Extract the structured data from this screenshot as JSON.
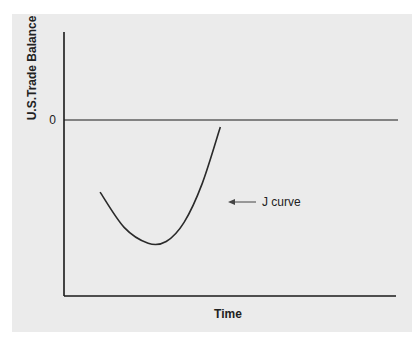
{
  "chart_data": {
    "type": "line",
    "title": "",
    "xlabel": "Time",
    "ylabel": "U.S.Trade Balance",
    "y_ticks": [
      "0"
    ],
    "xlim": [
      0,
      10
    ],
    "ylim": [
      -10,
      5
    ],
    "grid": false,
    "reference_line": {
      "y": 0,
      "label": "0"
    },
    "series": [
      {
        "name": "J curve",
        "x": [
          1.2,
          2.0,
          2.8,
          3.4,
          4.0,
          4.6,
          5.2
        ],
        "y": [
          -4.1,
          -6.1,
          -7.0,
          -6.9,
          -5.8,
          -3.6,
          -0.4
        ]
      }
    ],
    "annotations": [
      {
        "text": "J curve",
        "points_to": "series:J curve",
        "arrow": true
      }
    ]
  }
}
